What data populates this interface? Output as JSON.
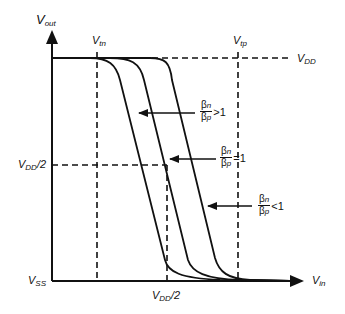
{
  "diagram": {
    "axes": {
      "y_label": "V",
      "y_label_sub": "out",
      "x_label": "V",
      "x_label_sub": "in"
    },
    "levels": {
      "vdd": {
        "main": "V",
        "sub": "DD",
        "suffix": ""
      },
      "vdd_half_y": {
        "main": "V",
        "sub": "DD",
        "suffix": "/2"
      },
      "vss": {
        "main": "V",
        "sub": "SS",
        "suffix": ""
      },
      "vdd_half_x": {
        "main": "V",
        "sub": "DD",
        "suffix": "/2"
      },
      "vtn": {
        "main": "V",
        "sub": "tn",
        "suffix": ""
      },
      "vtp": {
        "main": "V",
        "sub": "tp",
        "suffix": ""
      }
    },
    "curves": [
      {
        "label_num": "β",
        "label_num_sub": "n",
        "label_den": "β",
        "label_den_sub": "p",
        "relation": ">1"
      },
      {
        "label_num": "β",
        "label_num_sub": "n",
        "label_den": "β",
        "label_den_sub": "p",
        "relation": "=1"
      },
      {
        "label_num": "β",
        "label_num_sub": "n",
        "label_den": "β",
        "label_den_sub": "p",
        "relation": "<1"
      }
    ],
    "colors": {
      "line": "#111111",
      "background": "#ffffff"
    }
  }
}
